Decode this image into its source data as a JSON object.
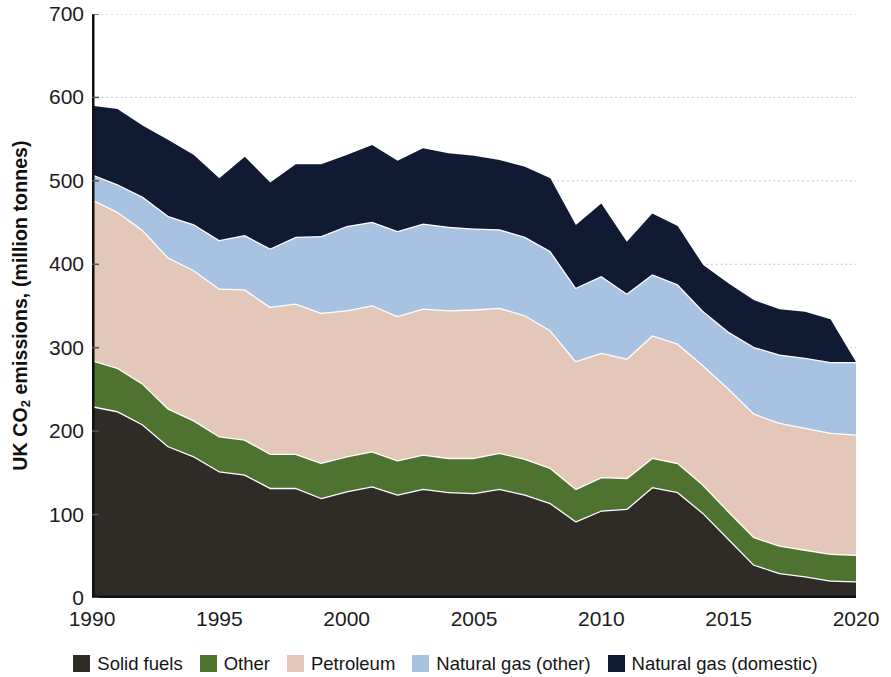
{
  "chart_data": {
    "type": "area",
    "stacked": true,
    "title": "",
    "subtitle": "",
    "xlabel": "",
    "ylabel": "UK CO2 emissions, (million tonnes)",
    "ylabel_parts": {
      "pre": "UK CO",
      "sub": "2",
      "post": " emissions, (million tonnes)"
    },
    "xlim": [
      1990,
      2020
    ],
    "ylim": [
      0,
      700
    ],
    "y_ticks": [
      0,
      100,
      200,
      300,
      400,
      500,
      600,
      700
    ],
    "x_ticks": [
      1990,
      1995,
      2000,
      2005,
      2010,
      2015,
      2020
    ],
    "grid": "horizontal-dotted",
    "legend_position": "bottom",
    "x": [
      1990,
      1991,
      1992,
      1993,
      1994,
      1995,
      1996,
      1997,
      1998,
      1999,
      2000,
      2001,
      2002,
      2003,
      2004,
      2005,
      2006,
      2007,
      2008,
      2009,
      2010,
      2011,
      2012,
      2013,
      2014,
      2015,
      2016,
      2017,
      2018,
      2019,
      2020
    ],
    "series": [
      {
        "name": "Solid fuels",
        "color": "#2f2c28",
        "values": [
          230,
          224,
          208,
          182,
          170,
          152,
          148,
          132,
          132,
          120,
          128,
          134,
          124,
          131,
          127,
          126,
          131,
          124,
          114,
          92,
          105,
          107,
          133,
          127,
          102,
          71,
          40,
          30,
          26,
          21,
          20
        ]
      },
      {
        "name": "Other",
        "color": "#4e7230",
        "values": [
          55,
          52,
          49,
          45,
          43,
          42,
          42,
          41,
          41,
          42,
          42,
          42,
          41,
          41,
          41,
          42,
          43,
          43,
          42,
          39,
          40,
          37,
          35,
          35,
          34,
          33,
          33,
          33,
          32,
          32,
          32
        ]
      },
      {
        "name": "Petroleum",
        "color": "#e3c7b9",
        "values": [
          193,
          187,
          184,
          181,
          180,
          177,
          180,
          176,
          180,
          180,
          175,
          175,
          173,
          175,
          177,
          178,
          174,
          172,
          165,
          153,
          149,
          143,
          147,
          143,
          143,
          147,
          148,
          147,
          146,
          145,
          144
        ]
      },
      {
        "name": "Natural gas (other)",
        "color": "#a8c2e2",
        "values": [
          30,
          33,
          40,
          50,
          55,
          58,
          65,
          70,
          80,
          92,
          101,
          100,
          102,
          102,
          100,
          97,
          94,
          94,
          95,
          88,
          92,
          78,
          73,
          71,
          65,
          68,
          80,
          82,
          84,
          85,
          87
        ]
      },
      {
        "name": "Natural gas (domestic)",
        "color": "#101a33",
        "values": [
          82,
          90,
          85,
          91,
          83,
          74,
          94,
          79,
          87,
          86,
          85,
          92,
          84,
          90,
          88,
          87,
          83,
          84,
          87,
          75,
          87,
          62,
          73,
          70,
          55,
          58,
          56,
          54,
          55,
          51,
          0
        ]
      }
    ],
    "legend": [
      {
        "label": "Solid fuels",
        "color": "#2f2c28"
      },
      {
        "label": "Other",
        "color": "#4e7230"
      },
      {
        "label": "Petroleum",
        "color": "#e3c7b9"
      },
      {
        "label": "Natural gas (other)",
        "color": "#a8c2e2"
      },
      {
        "label": "Natural gas (domestic)",
        "color": "#101a33"
      }
    ]
  },
  "axis": {
    "y_tick_labels": [
      "700",
      "600",
      "500",
      "400",
      "300",
      "200",
      "100",
      "0"
    ],
    "x_tick_labels": [
      "1990",
      "1995",
      "2000",
      "2005",
      "2010",
      "2015",
      "2020"
    ]
  },
  "colors": {
    "axis_line": "#111111",
    "grid_line": "#b9b9b9",
    "area_separator": "#ffffff",
    "text": "#1b1b1b",
    "background": "#ffffff"
  }
}
